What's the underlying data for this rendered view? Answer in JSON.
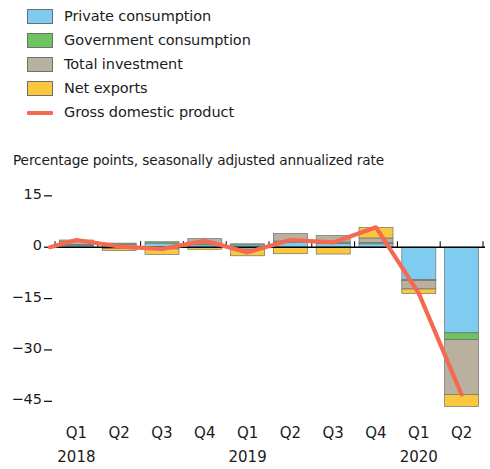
{
  "legend": {
    "items": [
      {
        "label": "Private consumption",
        "color": "#7ecdf0",
        "type": "swatch"
      },
      {
        "label": "Government consumption",
        "color": "#6cc35f",
        "type": "swatch"
      },
      {
        "label": "Total investment",
        "color": "#b9b0a0",
        "type": "swatch"
      },
      {
        "label": "Net exports",
        "color": "#fac83c",
        "type": "swatch"
      },
      {
        "label": "Gross domestic product",
        "color": "#f4694f",
        "type": "line"
      }
    ]
  },
  "subtitle": "Percentage points, seasonally adjusted annualized rate",
  "yaxis": {
    "ticks": [
      "15",
      "0",
      "−15",
      "−30",
      "−45"
    ],
    "values": [
      15,
      0,
      -15,
      -30,
      -45
    ]
  },
  "xaxis": {
    "quarters": [
      "Q1",
      "Q2",
      "Q3",
      "Q4",
      "Q1",
      "Q2",
      "Q3",
      "Q4",
      "Q1",
      "Q2"
    ],
    "years": [
      {
        "label": "2018",
        "at": 1
      },
      {
        "label": "2019",
        "at": 5
      },
      {
        "label": "2020",
        "at": 9
      }
    ]
  },
  "chart_data": {
    "type": "bar",
    "stacked": true,
    "title": "",
    "subtitle": "Percentage points, seasonally adjusted annualized rate",
    "xlabel": "",
    "ylabel": "Percentage points, seasonally adjusted annualized rate",
    "ylim": [
      -49,
      17
    ],
    "yticks": [
      15,
      0,
      -15,
      -30,
      -45
    ],
    "grid": false,
    "legend_position": "above-plot-left",
    "categories": [
      "Q1 2018",
      "Q2 2018",
      "Q3 2018",
      "Q4 2018",
      "Q1 2019",
      "Q2 2019",
      "Q3 2019",
      "Q4 2019",
      "Q1 2020",
      "Q2 2020"
    ],
    "series": [
      {
        "name": "Private consumption",
        "color": "#7ecdf0",
        "values": [
          0.6,
          0.9,
          1.2,
          0.8,
          0.7,
          1.4,
          1.1,
          1.0,
          -9.5,
          -25.0
        ]
      },
      {
        "name": "Government consumption",
        "color": "#6cc35f",
        "values": [
          0.2,
          0.3,
          0.4,
          0.2,
          0.3,
          0.4,
          0.4,
          0.4,
          -0.2,
          -2.0
        ]
      },
      {
        "name": "Total investment",
        "color": "#b9b0a0",
        "values": [
          1.0,
          -0.4,
          -0.5,
          1.5,
          -0.6,
          2.2,
          1.9,
          1.3,
          -2.5,
          -16.0
        ]
      },
      {
        "name": "Net exports",
        "color": "#fac83c",
        "values": [
          0.3,
          -0.6,
          -1.6,
          -0.6,
          -1.9,
          -1.9,
          -2.0,
          3.1,
          -1.3,
          -3.5
        ]
      }
    ],
    "line_series": {
      "name": "Gross domestic product",
      "color": "#f4694f",
      "values": [
        2.1,
        0.2,
        -0.5,
        1.9,
        -1.5,
        2.1,
        1.4,
        5.8,
        -13.5,
        -43.0
      ]
    }
  },
  "colors": {
    "private_consumption": "#7ecdf0",
    "government_consumption": "#6cc35f",
    "total_investment": "#b9b0a0",
    "net_exports": "#fac83c",
    "gdp_line": "#f4694f",
    "axis": "#000000",
    "text": "#1b1b1b"
  }
}
